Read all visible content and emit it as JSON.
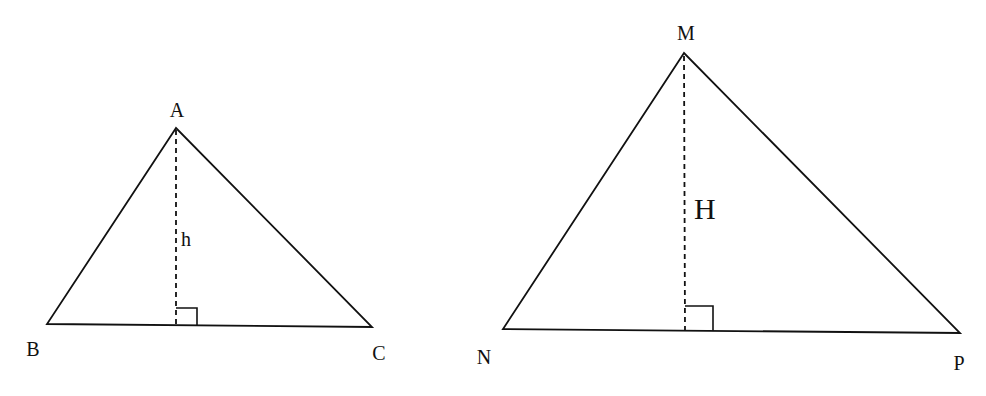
{
  "diagram": {
    "title": "",
    "colors": {
      "line": "#111111",
      "background": "#ffffff"
    },
    "triangles": [
      {
        "name": "ABC",
        "vertices": {
          "A": {
            "label": "A",
            "x": 176,
            "y": 128
          },
          "B": {
            "label": "B",
            "x": 47,
            "y": 324
          },
          "C": {
            "label": "C",
            "x": 372,
            "y": 327
          }
        },
        "altitude": {
          "label": "h",
          "from": "A",
          "foot": {
            "x": 176,
            "y": 325
          },
          "style": "dashed"
        },
        "right_angle_marker": true
      },
      {
        "name": "MNP",
        "vertices": {
          "M": {
            "label": "M",
            "x": 684,
            "y": 53
          },
          "N": {
            "label": "N",
            "x": 503,
            "y": 329
          },
          "P": {
            "label": "P",
            "x": 960,
            "y": 333
          }
        },
        "altitude": {
          "label": "H",
          "from": "M",
          "foot": {
            "x": 685,
            "y": 331
          },
          "style": "dashed"
        },
        "right_angle_marker": true
      }
    ]
  }
}
